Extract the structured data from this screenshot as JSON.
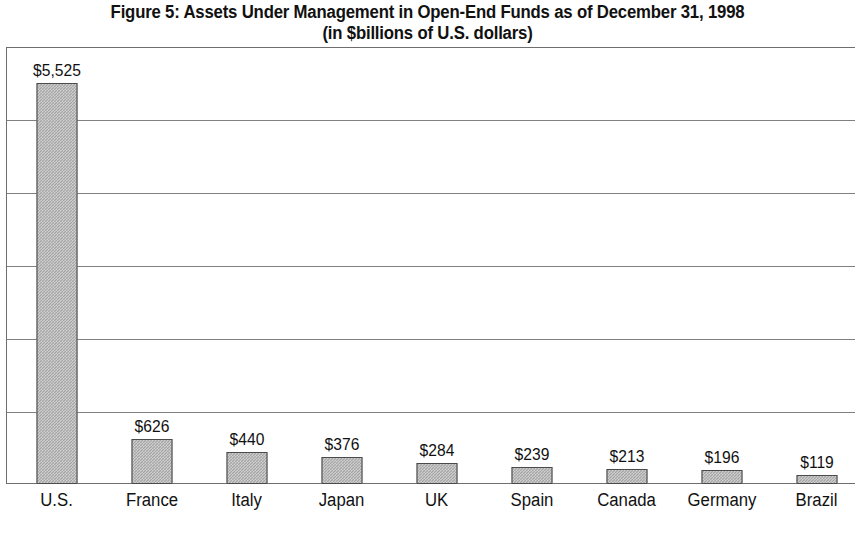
{
  "figure": {
    "title_line1": "Figure 5: Assets Under Management in Open-End Funds as of December 31, 1998",
    "title_line2": "(in $billions of U.S. dollars)"
  },
  "chart_data": {
    "type": "bar",
    "title": "Figure 5: Assets Under Management in Open-End Funds as of December 31, 1998 (in $billions of U.S. dollars)",
    "subtitle": "(in $billions of U.S. dollars)",
    "xlabel": "",
    "ylabel": "",
    "ylim": [
      0,
      6000
    ],
    "grid": true,
    "gridline_values": [
      1000,
      2000,
      3000,
      4000,
      5000,
      6000
    ],
    "axis_tick_labels_shown": false,
    "legend": null,
    "bar_color": "#a6a6a6",
    "bar_edge_color": "#4a4a4a",
    "categories": [
      "U.S.",
      "France",
      "Italy",
      "Japan",
      "UK",
      "Spain",
      "Canada",
      "Germany",
      "Brazil"
    ],
    "values": [
      5525,
      626,
      440,
      376,
      284,
      239,
      213,
      196,
      119
    ],
    "data_labels": [
      "$5,525",
      "$626",
      "$440",
      "$376",
      "$284",
      "$239",
      "$213",
      "$196",
      "$119"
    ],
    "points": [
      {
        "category": "U.S.",
        "value": 5525,
        "label": "$5,525"
      },
      {
        "category": "France",
        "value": 626,
        "label": "$626"
      },
      {
        "category": "Italy",
        "value": 440,
        "label": "$440"
      },
      {
        "category": "Japan",
        "value": 376,
        "label": "$376"
      },
      {
        "category": "UK",
        "value": 284,
        "label": "$284"
      },
      {
        "category": "Spain",
        "value": 239,
        "label": "$239"
      },
      {
        "category": "Canada",
        "value": 213,
        "label": "$213"
      },
      {
        "category": "Germany",
        "value": 196,
        "label": "$196"
      },
      {
        "category": "Brazil",
        "value": 119,
        "label": "$119"
      }
    ]
  }
}
